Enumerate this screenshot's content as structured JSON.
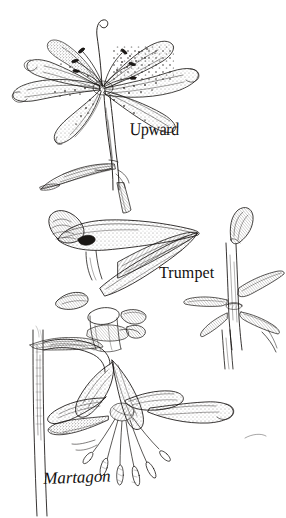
{
  "plate": {
    "title": "Lily flower forms",
    "medium": "pen-and-ink botanical illustration",
    "background_color": "#ffffff",
    "ink_color": "#14110f",
    "width": 286,
    "height": 518
  },
  "figures": [
    {
      "id": "upward",
      "label": "Upward",
      "label_position": {
        "x": 130,
        "y": 120
      },
      "description": "Upward-facing lily bloom with six spreading recurved spotted tepals, long arching pistil with hooked stigma, erect stem and a lance-shaped leaf below",
      "bounds": {
        "x": 8,
        "y": 12,
        "width": 200,
        "height": 180
      }
    },
    {
      "id": "trumpet",
      "label": "Trumpet",
      "label_position": {
        "x": 159,
        "y": 264
      },
      "description": "Side view of a horizontal trumpet-shaped lily flower with a long fused funnel tube, flaring limb, nodding bud and an upright leafy stem at right",
      "bounds": {
        "x": 26,
        "y": 195,
        "width": 250,
        "height": 155
      }
    },
    {
      "id": "martagon",
      "label": "Martagon",
      "label_position": {
        "x": 43,
        "y": 470
      },
      "description": "Pendent Turk's-cap lily on an arching pedicel from a vertical stem, with strongly reflexed tepals and six long protruding stamens with anthers",
      "bounds": {
        "x": 20,
        "y": 330,
        "width": 230,
        "height": 185
      }
    }
  ],
  "labels": {
    "upward": "Upward",
    "trumpet": "Trumpet",
    "martagon": "Martagon"
  }
}
